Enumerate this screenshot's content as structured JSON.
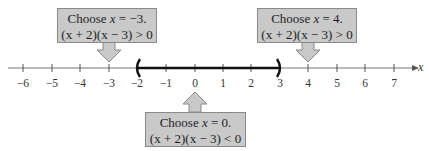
{
  "axis": {
    "variable": "x",
    "ticks": [
      "−6",
      "−5",
      "−4",
      "−3",
      "−2",
      "−1",
      "0",
      "1",
      "2",
      "3",
      "4",
      "5",
      "6",
      "7"
    ],
    "interval": {
      "left": "(",
      "right": ")",
      "from": -2,
      "to": 3
    }
  },
  "callouts": {
    "left": {
      "line1_prefix": "Choose ",
      "var": "x",
      "line1_suffix": " = −3.",
      "line2": "(x + 2)(x − 3) > 0",
      "points_to": -3
    },
    "right": {
      "line1_prefix": "Choose ",
      "var": "x",
      "line1_suffix": " = 4.",
      "line2": "(x + 2)(x − 3) > 0",
      "points_to": 4
    },
    "bottom": {
      "line1_prefix": "Choose ",
      "var": "x",
      "line1_suffix": " = 0.",
      "line2": "(x + 2)(x − 3) < 0",
      "points_to": 0
    }
  },
  "colors": {
    "box_fill": "#c9c9c9",
    "box_border": "#8a8a8a",
    "axis": "#555555",
    "interval": "#111111"
  }
}
